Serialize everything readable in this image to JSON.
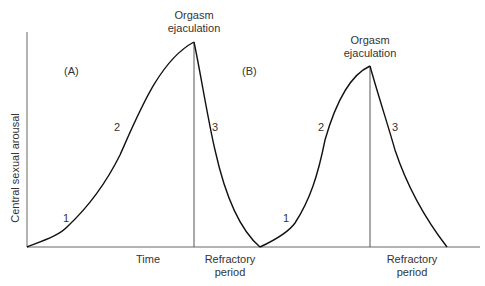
{
  "diagram": {
    "y_axis_label": "Central sexual arousal",
    "x_axis_label": "Time",
    "panels": [
      {
        "id": "A",
        "label": "(A)",
        "peak_label_line1": "Orgasm",
        "peak_label_line2": "ejaculation",
        "after_label_line1": "Refractory",
        "after_label_line2": "period",
        "phases": [
          "1",
          "2",
          "3"
        ]
      },
      {
        "id": "B",
        "label": "(B)",
        "peak_label_line1": "Orgasm",
        "peak_label_line2": "ejaculation",
        "after_label_line1": "Refractory",
        "after_label_line2": "period",
        "phases": [
          "1",
          "2",
          "3"
        ]
      }
    ],
    "colors": {
      "line": "#111111",
      "axis": "#555555",
      "text": "#333333"
    }
  }
}
